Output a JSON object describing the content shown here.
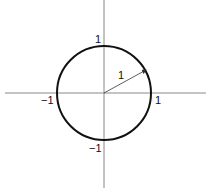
{
  "diagram": {
    "colors": {
      "axis": "#888888",
      "circle": "#111111",
      "arrow": "#333333",
      "label": "#111111"
    },
    "center": {
      "x": 104,
      "y": 93
    },
    "radius_px": 47,
    "labels": {
      "y_top": "1",
      "y_bottom": "−1",
      "x_left": "−1",
      "x_right": "1",
      "radius": "1"
    }
  }
}
